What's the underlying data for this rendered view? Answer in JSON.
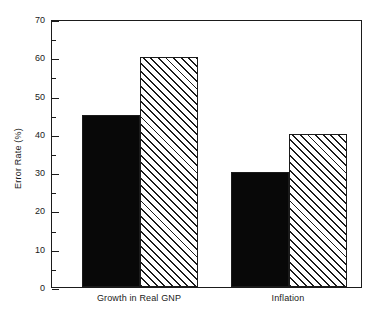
{
  "chart_data": {
    "type": "bar",
    "title": "",
    "subtitle": "",
    "xlabel": "",
    "ylabel": "Error Rate (%)",
    "categories": [
      "Growth in Real GNP",
      "Inflation"
    ],
    "series": [
      {
        "name": "series-1",
        "fill": "solid-black",
        "values": [
          45,
          60
        ]
      },
      {
        "name": "series-2",
        "fill": "hatched-diagonal",
        "values": [
          30,
          40
        ]
      }
    ],
    "grouped_values": {
      "Growth in Real GNP": {
        "solid": 45,
        "hatched": 60
      },
      "Inflation": {
        "solid": 30,
        "hatched": 40
      }
    },
    "ylim": [
      0,
      70
    ],
    "ytick_major": [
      0,
      10,
      20,
      30,
      40,
      50,
      60,
      70
    ],
    "ytick_minor": [
      5,
      15,
      25,
      35,
      45,
      55,
      65
    ],
    "ytick_labels": [
      "0",
      "10",
      "20",
      "30",
      "40",
      "50",
      "60",
      "70"
    ],
    "xtick_labels": [],
    "grid": false,
    "legend": null,
    "legend_position": "none",
    "annotations": [],
    "colors": {
      "solid_bar": "#080808",
      "hatched_bar_line": "#1b1b1b",
      "hatched_bar_background": "#ffffff",
      "axis": "#1b1b1b",
      "text": "#1a1a1a",
      "background": "#ffffff"
    }
  }
}
